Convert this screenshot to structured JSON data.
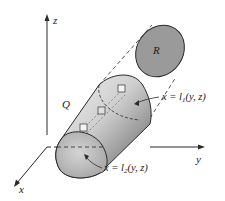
{
  "diagram": {
    "type": "3d-solid-projection",
    "axes": {
      "x_label": "x",
      "y_label": "y",
      "z_label": "z"
    },
    "solid_label": "Q",
    "region_label": "R",
    "surface_upper": {
      "lhs": "x = ",
      "func": "l",
      "sub": "1",
      "args": "(y, z)"
    },
    "surface_lower": {
      "lhs": "x = ",
      "func": "l",
      "sub": "2",
      "args": "(y, z)"
    },
    "colors": {
      "background": "#ffffff",
      "line": "#2a2a2a",
      "region_fill": "#9a9a9a",
      "solid_light": "#e8e8e8",
      "solid_dark": "#6e6e6e",
      "cap_fill": "#bdbdbd"
    }
  }
}
